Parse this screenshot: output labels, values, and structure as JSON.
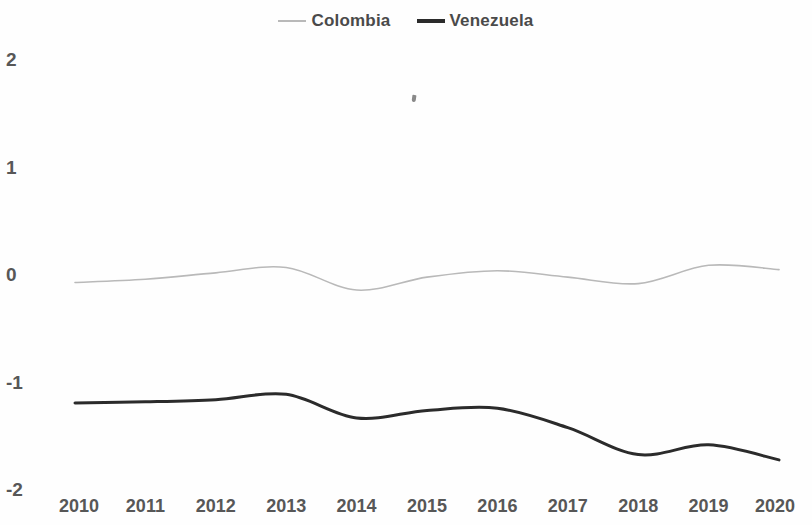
{
  "chart_data": {
    "type": "line",
    "title": "",
    "subtitle": "",
    "xlabel": "",
    "ylabel": "",
    "x": [
      2010,
      2011,
      2012,
      2013,
      2014,
      2015,
      2016,
      2017,
      2018,
      2019,
      2020
    ],
    "categories": [
      "2010",
      "2011",
      "2012",
      "2013",
      "2014",
      "2015",
      "2016",
      "2017",
      "2018",
      "2019",
      "2020"
    ],
    "xlim": [
      2010,
      2020
    ],
    "ylim": [
      -2,
      2
    ],
    "ytick_labels": [
      "2",
      "1",
      "0",
      "-1",
      "-2"
    ],
    "ytick_values": [
      2,
      1,
      0,
      -1,
      -2
    ],
    "grid": false,
    "legend_position": "top-center",
    "series": [
      {
        "name": "Colombia",
        "color": "#b9b9b9",
        "line_width": 1.6,
        "values": [
          -0.07,
          -0.04,
          0.02,
          0.07,
          -0.14,
          -0.02,
          0.04,
          -0.02,
          -0.08,
          0.09,
          0.05
        ]
      },
      {
        "name": "Venezuela",
        "color": "#2b2b2b",
        "line_width": 3.0,
        "values": [
          -1.19,
          -1.18,
          -1.16,
          -1.11,
          -1.33,
          -1.26,
          -1.24,
          -1.42,
          -1.67,
          -1.58,
          -1.72
        ]
      }
    ],
    "annotations": [
      {
        "name": "scan-speck",
        "x_px": 412,
        "y_px": 95
      }
    ]
  },
  "legend": {
    "entries": [
      {
        "label": "Colombia",
        "swatch": "line-swatch-light"
      },
      {
        "label": "Venezuela",
        "swatch": "line-swatch-dark"
      }
    ]
  },
  "axes": {
    "y_labels": [
      "2",
      "1",
      "0",
      "-1",
      "-2"
    ],
    "x_labels": [
      "2010",
      "2011",
      "2012",
      "2013",
      "2014",
      "2015",
      "2016",
      "2017",
      "2018",
      "2019",
      "2020"
    ]
  },
  "colors": {
    "colombia": "#b9b9b9",
    "venezuela": "#2b2b2b",
    "axis_text": "#575757",
    "legend_text": "#4a4a4a",
    "background": "#ffffff"
  }
}
